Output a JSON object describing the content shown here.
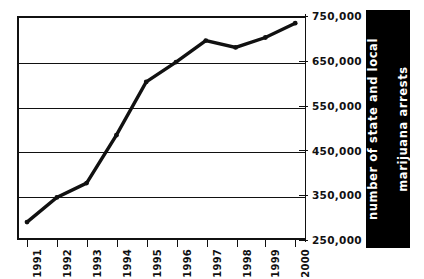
{
  "chart_data": {
    "type": "line",
    "title": "",
    "xlabel": "",
    "ylabel": "number of state and local marijuana arrests",
    "ylabel_line1": "number of state and local",
    "ylabel_line2": "marijuana arrests",
    "categories": [
      "1991",
      "1992",
      "1993",
      "1994",
      "1995",
      "1996",
      "1997",
      "1998",
      "1999",
      "2000"
    ],
    "values": [
      290000,
      345000,
      377000,
      484000,
      603000,
      647000,
      695000,
      680000,
      702000,
      734000
    ],
    "series": [
      {
        "name": "state and local marijuana arrests",
        "values": [
          290000,
          345000,
          377000,
          484000,
          603000,
          647000,
          695000,
          680000,
          702000,
          734000
        ]
      }
    ],
    "ylim": [
      250000,
      750000
    ],
    "ytick_values": [
      250000,
      350000,
      450000,
      550000,
      650000,
      750000
    ],
    "ytick_labels": [
      "250,000",
      "350,000",
      "450,000",
      "550,000",
      "650,000",
      "750,000"
    ],
    "grid": true,
    "grid_axis": "y",
    "legend": false,
    "legend_position": "none",
    "line_color": "#111111",
    "axis_title_background": "#000000",
    "axis_title_color": "#ffffff"
  },
  "axis": {
    "y_labels": [
      "750,000",
      "650,000",
      "550,000",
      "450,000",
      "350,000",
      "250,000"
    ],
    "x_labels": [
      "1991",
      "1992",
      "1993",
      "1994",
      "1995",
      "1996",
      "1997",
      "1998",
      "1999",
      "2000"
    ],
    "title_line1": "number of state and local",
    "title_line2": "marijuana arrests"
  }
}
